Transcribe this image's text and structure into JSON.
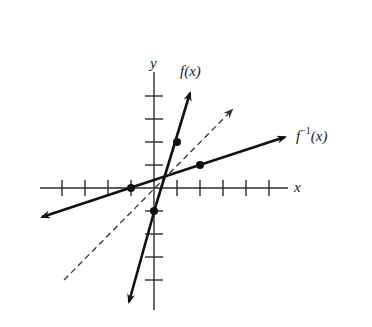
{
  "figure": {
    "type": "function-inverse-graph",
    "labels": {
      "x_axis": "x",
      "y_axis": "y",
      "f": "f(x)",
      "f_inverse_base": "f",
      "f_inverse_sup": "−1",
      "f_inverse_arg": "(x)"
    },
    "colors": {
      "background": "#ffffff",
      "ink": "#111111"
    },
    "axes": {
      "x_ticks_left": 4,
      "x_ticks_right": 5,
      "y_ticks_up": 4,
      "y_ticks_down": 4
    },
    "lines": [
      {
        "name": "f(x)",
        "style": "solid",
        "passes_through": [
          [
            0,
            -1
          ],
          [
            1,
            2
          ]
        ],
        "slope": 3
      },
      {
        "name": "f^-1(x)",
        "style": "solid",
        "passes_through": [
          [
            -1,
            0
          ],
          [
            2,
            1
          ]
        ],
        "slope": 0.333
      },
      {
        "name": "y = x",
        "style": "dashed",
        "slope": 1
      }
    ],
    "marked_points": [
      {
        "on": "f",
        "x": 0,
        "y": -1
      },
      {
        "on": "f",
        "x": 1,
        "y": 2
      },
      {
        "on": "f_inverse",
        "x": -1,
        "y": 0
      },
      {
        "on": "f_inverse",
        "x": 2,
        "y": 1
      }
    ]
  }
}
